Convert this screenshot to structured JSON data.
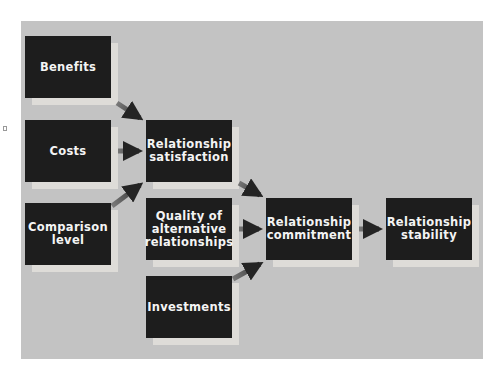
{
  "diagram": {
    "colors": {
      "panel": "#c3c3c3",
      "box": "#1d1d1d",
      "box_text": "#f4f4f4",
      "shadow": "#dedcd8",
      "arrow": "#2a2a2a"
    },
    "nodes": [
      {
        "id": "benefits",
        "label": "Benefits"
      },
      {
        "id": "costs",
        "label": "Costs"
      },
      {
        "id": "comparison_level",
        "label": "Comparison\nlevel"
      },
      {
        "id": "satisfaction",
        "label": "Relationship\nsatisfaction"
      },
      {
        "id": "alternatives",
        "label": "Quality of\nalternative\nrelationships"
      },
      {
        "id": "investments",
        "label": "Investments"
      },
      {
        "id": "commitment",
        "label": "Relationship\ncommitment"
      },
      {
        "id": "stability",
        "label": "Relationship\nstability"
      }
    ],
    "edges": [
      {
        "from": "benefits",
        "to": "satisfaction"
      },
      {
        "from": "costs",
        "to": "satisfaction"
      },
      {
        "from": "comparison_level",
        "to": "satisfaction"
      },
      {
        "from": "satisfaction",
        "to": "commitment"
      },
      {
        "from": "alternatives",
        "to": "commitment"
      },
      {
        "from": "investments",
        "to": "commitment"
      },
      {
        "from": "commitment",
        "to": "stability"
      }
    ]
  }
}
